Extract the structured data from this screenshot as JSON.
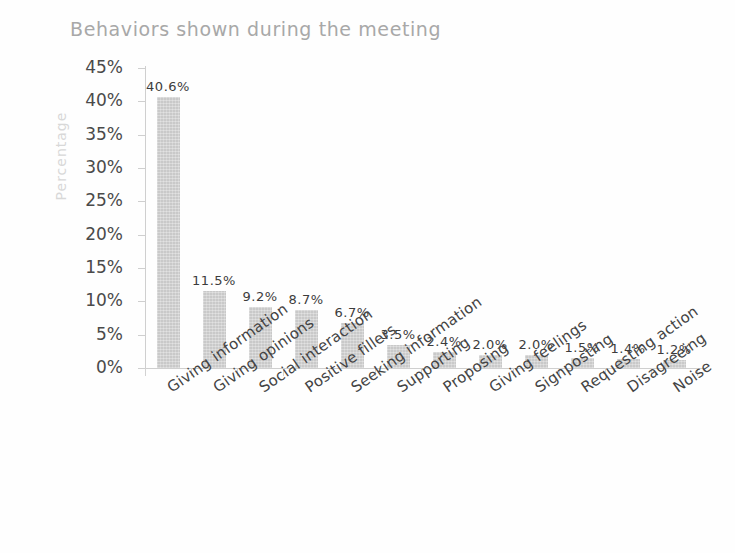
{
  "chart_data": {
    "type": "bar",
    "title": "Behaviors shown during the meeting",
    "xlabel": "",
    "ylabel": "Percentage",
    "ylim": [
      0,
      45
    ],
    "ytick_labels": [
      "45%",
      "40%",
      "35%",
      "30%",
      "25%",
      "20%",
      "15%",
      "10%",
      "5%",
      "0%"
    ],
    "ytick_values": [
      45,
      40,
      35,
      30,
      25,
      20,
      15,
      10,
      5,
      0
    ],
    "grid": false,
    "legend": "none",
    "categories": [
      "Giving information",
      "Giving opinions",
      "Social interaction",
      "Positive fillers",
      "Seeking information",
      "Supporting",
      "Proposing",
      "Giving feelings",
      "Signposting",
      "Requesting action",
      "Disagreeing",
      "Noise"
    ],
    "values": [
      40.6,
      11.5,
      9.2,
      8.7,
      6.7,
      3.5,
      2.4,
      2.0,
      2.0,
      1.5,
      1.4,
      1.2
    ],
    "value_labels": [
      "40.6%",
      "11.5%",
      "9.2%",
      "8.7%",
      "6.7%",
      "3.5%",
      "2.4%",
      "2.0%",
      "2.0%",
      "1.5%",
      "1.4%",
      "1.2%"
    ],
    "bar_color": "#c9c9c9",
    "axis_color": "#cfcfcf",
    "title_color": "#a8a8a8",
    "label_color": "#444444"
  }
}
